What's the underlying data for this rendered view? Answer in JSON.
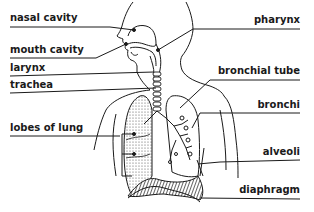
{
  "diagram": {
    "left_labels": [
      {
        "text": "nasal cavity"
      },
      {
        "text": "mouth cavity"
      },
      {
        "text": "larynx"
      },
      {
        "text": "trachea"
      },
      {
        "text": "lobes of lung"
      }
    ],
    "right_labels": [
      {
        "text": "pharynx"
      },
      {
        "text": "bronchial tube"
      },
      {
        "text": "bronchi"
      },
      {
        "text": "alveoli"
      },
      {
        "text": "diaphragm"
      }
    ],
    "colors": {
      "line": "#1a1a1a",
      "background": "#ffffff",
      "lung_shading": "#8a8a8a"
    }
  }
}
